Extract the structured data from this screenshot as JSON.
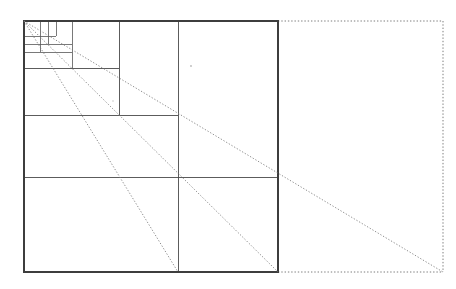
{
  "figure": {
    "canvas": {
      "width": 456,
      "height": 289
    },
    "colors": {
      "background": "#ffffff",
      "solid_line": "#4a4a4a",
      "outer_line": "#3d3d3d",
      "fine_line": "#575757",
      "dotted_line": "#6e6e6e",
      "ray_line": "#7a7a7a"
    }
  },
  "chart_data": {
    "type": "diagram",
    "xlabel": "",
    "ylabel": "",
    "main_square": {
      "name": "unit-square",
      "x0": 24,
      "y0": 21,
      "x1": 278,
      "y1": 272,
      "side_px": 254,
      "style": "solid"
    },
    "extension_rectangle": {
      "name": "dotted-extension",
      "x0": 278,
      "y0": 21,
      "x1": 443,
      "y1": 272,
      "style": "dotted"
    },
    "vertical_grid_x": [
      24,
      40,
      48,
      56,
      72,
      119,
      178,
      278
    ],
    "horizontal_grid_y": [
      21,
      36,
      44,
      52,
      68,
      115,
      177,
      272
    ],
    "subdivision_fractions": [
      1,
      0.5,
      0.25,
      0.125,
      0.0625,
      0.03125,
      0.015625
    ],
    "vertical_lines": [
      {
        "x": 24,
        "y_top": 21,
        "y_bottom": 272,
        "style": "solid"
      },
      {
        "x": 40,
        "y_top": 21,
        "y_bottom": 52,
        "style": "solid"
      },
      {
        "x": 48,
        "y_top": 21,
        "y_bottom": 44,
        "style": "solid"
      },
      {
        "x": 56,
        "y_top": 21,
        "y_bottom": 36,
        "style": "solid"
      },
      {
        "x": 72,
        "y_top": 21,
        "y_bottom": 68,
        "style": "solid"
      },
      {
        "x": 119,
        "y_top": 21,
        "y_bottom": 115,
        "style": "solid"
      },
      {
        "x": 178,
        "y_top": 21,
        "y_bottom": 272,
        "style": "solid"
      },
      {
        "x": 278,
        "y_top": 21,
        "y_bottom": 272,
        "style": "solid"
      }
    ],
    "horizontal_lines": [
      {
        "y": 21,
        "x_left": 24,
        "x_right": 278,
        "style": "solid"
      },
      {
        "y": 36,
        "x_left": 24,
        "x_right": 56,
        "style": "solid"
      },
      {
        "y": 44,
        "x_left": 24,
        "x_right": 72,
        "style": "solid"
      },
      {
        "y": 52,
        "x_left": 24,
        "x_right": 72,
        "style": "solid"
      },
      {
        "y": 68,
        "x_left": 24,
        "x_right": 119,
        "style": "solid"
      },
      {
        "y": 115,
        "x_left": 24,
        "x_right": 178,
        "style": "solid"
      },
      {
        "y": 177,
        "x_left": 24,
        "x_right": 278,
        "style": "solid"
      },
      {
        "y": 272,
        "x_left": 24,
        "x_right": 278,
        "style": "solid"
      }
    ],
    "dotted_rays": [
      {
        "name": "ray-1",
        "x0": 24,
        "y0": 21,
        "x1": 178,
        "y1": 272
      },
      {
        "name": "ray-2",
        "x0": 24,
        "y0": 21,
        "x1": 278,
        "y1": 272
      },
      {
        "name": "ray-3",
        "x0": 24,
        "y0": 21,
        "x1": 443,
        "y1": 272
      }
    ],
    "dotted_edges": [
      {
        "name": "dotted-top",
        "x0": 278,
        "y0": 21,
        "x1": 443,
        "y1": 21
      },
      {
        "name": "dotted-right",
        "x0": 443,
        "y0": 21,
        "x1": 443,
        "y1": 272
      },
      {
        "name": "dotted-bottom",
        "x0": 278,
        "y0": 272,
        "x1": 443,
        "y1": 272
      }
    ],
    "specks": [
      {
        "x": 191,
        "y": 66,
        "r": 0.9
      },
      {
        "x": 113,
        "y": 101,
        "r": 0.7
      }
    ]
  }
}
